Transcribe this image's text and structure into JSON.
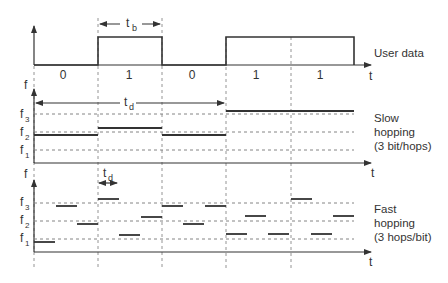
{
  "diagram": {
    "panels": {
      "user_data": {
        "label": "User data",
        "axis_label": "t",
        "bits": [
          "0",
          "1",
          "0",
          "1",
          "1"
        ],
        "bit_period_label": "t",
        "bit_period_sub": "b"
      },
      "slow_hopping": {
        "label_line1": "Slow",
        "label_line2": "hopping",
        "label_line3": "(3 bit/hops)",
        "y_axis_label": "f",
        "axis_label": "t",
        "dwell_label": "t",
        "dwell_sub": "d",
        "freq_levels": [
          {
            "name": "f",
            "sub": "3"
          },
          {
            "name": "f",
            "sub": "2"
          },
          {
            "name": "f",
            "sub": "1"
          }
        ]
      },
      "fast_hopping": {
        "label_line1": "Fast",
        "label_line2": "hopping",
        "label_line3": "(3 hops/bit)",
        "y_axis_label": "f",
        "axis_label": "t",
        "dwell_label": "t",
        "dwell_sub": "d",
        "freq_levels": [
          {
            "name": "f",
            "sub": "3"
          },
          {
            "name": "f",
            "sub": "2"
          },
          {
            "name": "f",
            "sub": "1"
          }
        ]
      }
    }
  }
}
